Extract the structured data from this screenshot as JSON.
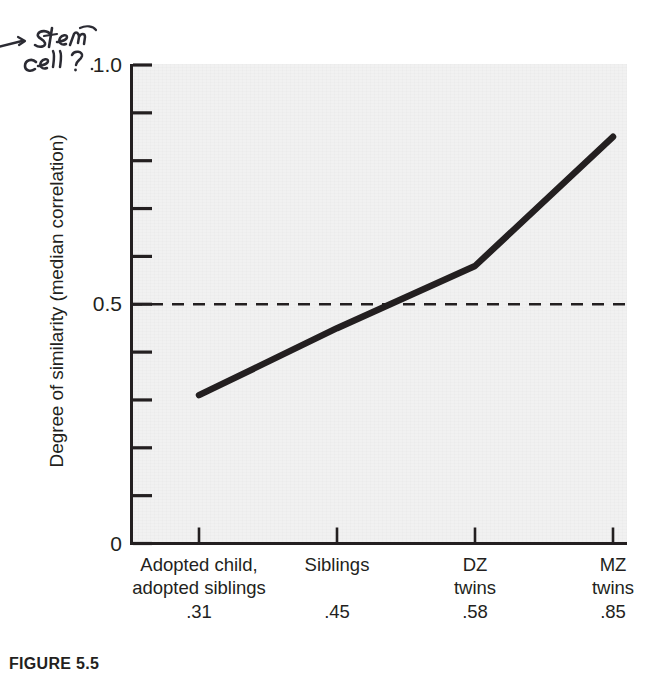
{
  "annotation": {
    "handwritten_note": "Stem cell?"
  },
  "caption": {
    "label": "FIGURE 5.5"
  },
  "chart_data": {
    "type": "line",
    "title": "",
    "xlabel": "",
    "ylabel": "Degree of similarity (median correlation)",
    "categories": [
      "Adopted child,\nadopted siblings",
      "Siblings",
      "DZ\ntwins",
      "MZ\ntwins"
    ],
    "category_lines": [
      [
        "Adopted child,",
        "adopted siblings"
      ],
      [
        "Siblings"
      ],
      [
        "DZ",
        "twins"
      ],
      [
        "MZ",
        "twins"
      ]
    ],
    "values": [
      0.31,
      0.45,
      0.58,
      0.85
    ],
    "value_labels": [
      ".31",
      ".45",
      ".58",
      ".85"
    ],
    "ylim": [
      0,
      1.0
    ],
    "y_tick_values": [
      0,
      0.1,
      0.2,
      0.3,
      0.4,
      0.5,
      0.6,
      0.7,
      0.8,
      0.9,
      1.0
    ],
    "y_tick_labels_shown": {
      "top": "1.0",
      "middle": "0.5",
      "bottom": "0"
    },
    "reference_line": {
      "value": 0.5,
      "style": "dashed"
    },
    "grid": false,
    "legend": "none",
    "plot_background": "#f1f1f1",
    "line_color": "#231f20"
  }
}
